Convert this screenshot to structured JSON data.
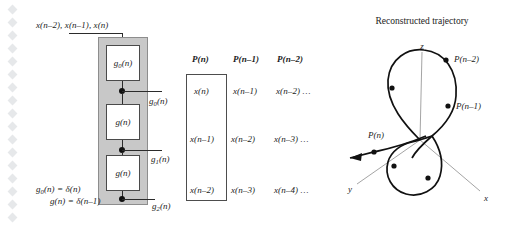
{
  "figure": {
    "input_label": "x(n–2),  x(n–1),  x(n)",
    "blocks": [
      {
        "name": "g0",
        "label_main": "g",
        "label_sub": "0",
        "label_tail": "(n)"
      },
      {
        "name": "g_mid",
        "label_main": "g",
        "label_sub": "",
        "label_tail": "(n)"
      },
      {
        "name": "g_bot",
        "label_main": "g",
        "label_sub": "",
        "label_tail": "(n)"
      }
    ],
    "taps": [
      {
        "name": "tap-g0",
        "label_main": "g",
        "label_sub": "0",
        "label_tail": "(n)"
      },
      {
        "name": "tap-g1",
        "label_main": "g",
        "label_sub": "1",
        "label_tail": "(n)"
      },
      {
        "name": "tap-g2",
        "label_main": "g",
        "label_sub": "2",
        "label_tail": "(n)"
      }
    ],
    "equations": [
      {
        "lhs_main": "g",
        "lhs_sub": "0",
        "text": "(n) = δ(n)"
      },
      {
        "lhs_main": "g",
        "lhs_sub": "",
        "text": "(n) = δ(n–1)"
      }
    ]
  },
  "matrix": {
    "headers": [
      "P(n)",
      "P(n–1)",
      "P(n–2)"
    ],
    "rows": [
      [
        "x(n)",
        "x(n–1)",
        "x(n–2) …"
      ],
      [
        "x(n–1)",
        "x(n–2)",
        "x(n–3) …"
      ],
      [
        "x(n–2)",
        "x(n–3)",
        "x(n–4) …"
      ]
    ]
  },
  "trajectory": {
    "title": "Reconstructed trajectory",
    "axes": [
      {
        "name": "z",
        "label": "z"
      },
      {
        "name": "y",
        "label": "y"
      },
      {
        "name": "x",
        "label": "x"
      }
    ],
    "point_labels": [
      {
        "name": "p-n-minus-2",
        "label": "P(n–2)"
      },
      {
        "name": "p-n-minus-1",
        "label": "P(n–1)"
      },
      {
        "name": "p-n",
        "label": "P(n)"
      }
    ]
  },
  "colors": {
    "panel_gray": "#c8c8c8",
    "ink": "#1b1b1b",
    "wire": "#2b2b2b",
    "axis_gray": "#9a9a9a",
    "diamond": "#e6e8ea"
  }
}
